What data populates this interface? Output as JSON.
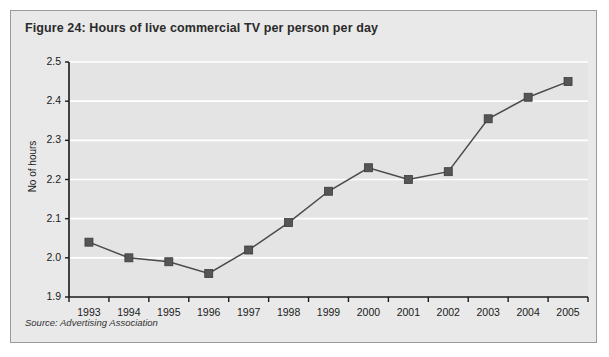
{
  "figure": {
    "title": "Figure 24: Hours of live commercial TV per person per day",
    "source": "Source: Advertising Association"
  },
  "colors": {
    "panel_background": "#e9e9e9",
    "panel_border": "#9a9a9a",
    "plot_background": "#e4e4e4",
    "gridline": "#ffffff",
    "axis": "#1a1a1a",
    "series_line": "#4a4a4a",
    "marker_fill": "#555555",
    "title_text": "#2b2b2b"
  },
  "chart_data": {
    "type": "line",
    "title": "Figure 24: Hours of live commercial TV per person per day",
    "xlabel": "",
    "ylabel": "No of hours",
    "categories": [
      "1993",
      "1994",
      "1995",
      "1996",
      "1997",
      "1998",
      "1999",
      "2000",
      "2001",
      "2002",
      "2003",
      "2004",
      "2005"
    ],
    "values": [
      2.04,
      2.0,
      1.99,
      1.96,
      2.02,
      2.09,
      2.17,
      2.23,
      2.2,
      2.22,
      2.355,
      2.41,
      2.45
    ],
    "ylim": [
      1.9,
      2.5
    ],
    "ytick_labels": [
      "2.5",
      "2.4",
      "2.3",
      "2.2",
      "2.1",
      "2.0",
      "1.9"
    ],
    "ytick_values": [
      2.5,
      2.4,
      2.3,
      2.2,
      2.1,
      2.0,
      1.9
    ],
    "grid": true,
    "legend": false,
    "marker": "square",
    "series": [
      {
        "name": "Hours of live commercial TV per person per day",
        "values": [
          2.04,
          2.0,
          1.99,
          1.96,
          2.02,
          2.09,
          2.17,
          2.23,
          2.2,
          2.22,
          2.355,
          2.41,
          2.45
        ]
      }
    ]
  }
}
